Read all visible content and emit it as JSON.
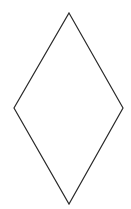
{
  "diagram": {
    "shape": "rhombus",
    "stroke_color": "#2a2a2a",
    "fill_color": "#ffffff",
    "stroke_width": 1.2,
    "vertices": {
      "top": [
        69,
        13
      ],
      "right": [
        123,
        108
      ],
      "bottom": [
        69,
        204
      ],
      "left": [
        14,
        108
      ]
    }
  }
}
